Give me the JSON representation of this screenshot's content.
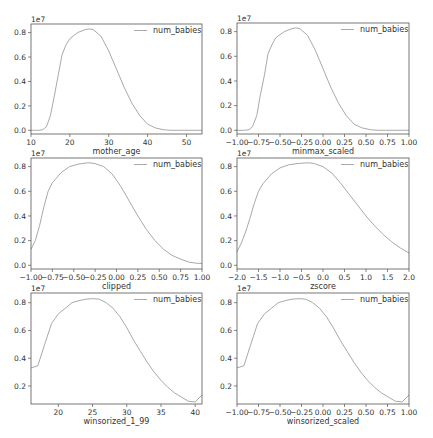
{
  "chart_data": [
    {
      "type": "line",
      "title": "",
      "xlabel": "mother_age",
      "ylabel": "",
      "y_offset_label": "1e7",
      "legend": [
        "num_babies"
      ],
      "legend_position": "upper right",
      "xlim": [
        10,
        54
      ],
      "ylim": [
        -0.03,
        0.87
      ],
      "xticks": [
        10,
        20,
        30,
        40,
        50
      ],
      "yticks": [
        0.0,
        0.2,
        0.4,
        0.6,
        0.8
      ],
      "x": [
        10,
        12,
        13,
        14,
        15,
        16,
        17,
        18,
        19,
        20,
        22,
        24,
        25,
        26,
        28,
        30,
        32,
        34,
        36,
        38,
        40,
        42,
        44,
        46,
        48,
        54
      ],
      "series": [
        {
          "name": "num_babies",
          "values": [
            0.0,
            0.0,
            0.005,
            0.03,
            0.12,
            0.28,
            0.45,
            0.62,
            0.7,
            0.75,
            0.8,
            0.825,
            0.83,
            0.825,
            0.77,
            0.65,
            0.5,
            0.35,
            0.22,
            0.12,
            0.05,
            0.02,
            0.005,
            0.0,
            0.0,
            0.0
          ]
        }
      ]
    },
    {
      "type": "line",
      "title": "",
      "xlabel": "minmax_scaled",
      "ylabel": "",
      "y_offset_label": "1e7",
      "legend": [
        "num_babies"
      ],
      "legend_position": "upper right",
      "xlim": [
        -1.0,
        1.0
      ],
      "ylim": [
        -0.03,
        0.87
      ],
      "xticks": [
        "-1.00",
        "-0.75",
        "-0.50",
        "-0.25",
        "0.00",
        "0.25",
        "0.50",
        "0.75",
        "1.00"
      ],
      "yticks": [
        0.0,
        0.2,
        0.4,
        0.6,
        0.8
      ],
      "x": [
        -1.0,
        -0.91,
        -0.86,
        -0.82,
        -0.77,
        -0.73,
        -0.68,
        -0.64,
        -0.59,
        -0.55,
        -0.45,
        -0.36,
        -0.32,
        -0.27,
        -0.18,
        -0.09,
        0.0,
        0.09,
        0.18,
        0.27,
        0.36,
        0.45,
        0.55,
        0.64,
        0.73,
        1.0
      ],
      "series": [
        {
          "name": "num_babies",
          "values": [
            0.0,
            0.0,
            0.005,
            0.03,
            0.12,
            0.28,
            0.45,
            0.62,
            0.7,
            0.75,
            0.8,
            0.825,
            0.83,
            0.825,
            0.77,
            0.65,
            0.5,
            0.35,
            0.22,
            0.12,
            0.05,
            0.02,
            0.005,
            0.0,
            0.0,
            0.0
          ]
        }
      ]
    },
    {
      "type": "line",
      "title": "",
      "xlabel": "clipped",
      "ylabel": "",
      "y_offset_label": "1e7",
      "legend": [
        "num_babies"
      ],
      "legend_position": "upper right",
      "xlim": [
        -1.0,
        1.0
      ],
      "ylim": [
        -0.03,
        0.87
      ],
      "xticks": [
        "-1.00",
        "-0.75",
        "-0.50",
        "-0.25",
        "0.00",
        "0.25",
        "0.50",
        "0.75",
        "1.00"
      ],
      "yticks": [
        0.0,
        0.2,
        0.4,
        0.6,
        0.8
      ],
      "x": [
        -1.0,
        -0.95,
        -0.9,
        -0.85,
        -0.8,
        -0.75,
        -0.65,
        -0.55,
        -0.45,
        -0.35,
        -0.3,
        -0.25,
        -0.15,
        -0.05,
        0.05,
        0.15,
        0.25,
        0.35,
        0.45,
        0.55,
        0.65,
        0.75,
        0.85,
        0.95,
        1.0
      ],
      "series": [
        {
          "name": "num_babies",
          "values": [
            0.13,
            0.2,
            0.32,
            0.47,
            0.6,
            0.67,
            0.75,
            0.8,
            0.82,
            0.83,
            0.83,
            0.825,
            0.8,
            0.74,
            0.64,
            0.52,
            0.4,
            0.29,
            0.2,
            0.13,
            0.08,
            0.05,
            0.025,
            0.015,
            0.015
          ]
        }
      ]
    },
    {
      "type": "line",
      "title": "",
      "xlabel": "zscore",
      "ylabel": "",
      "y_offset_label": "1e7",
      "legend": [
        "num_babies"
      ],
      "legend_position": "upper right",
      "xlim": [
        -2.0,
        2.0
      ],
      "ylim": [
        -0.03,
        0.87
      ],
      "xticks": [
        "-2.0",
        "-1.5",
        "-1.0",
        "-0.5",
        "0.0",
        "0.5",
        "1.0",
        "1.5",
        "2.0"
      ],
      "yticks": [
        0.0,
        0.2,
        0.4,
        0.6,
        0.8
      ],
      "x": [
        -2.0,
        -1.9,
        -1.8,
        -1.7,
        -1.6,
        -1.5,
        -1.4,
        -1.2,
        -1.0,
        -0.8,
        -0.6,
        -0.4,
        -0.3,
        -0.2,
        0.0,
        0.2,
        0.4,
        0.6,
        0.8,
        1.0,
        1.2,
        1.4,
        1.6,
        1.8,
        2.0
      ],
      "series": [
        {
          "name": "num_babies",
          "values": [
            0.11,
            0.18,
            0.27,
            0.38,
            0.5,
            0.6,
            0.66,
            0.74,
            0.79,
            0.815,
            0.825,
            0.83,
            0.83,
            0.825,
            0.8,
            0.75,
            0.67,
            0.58,
            0.49,
            0.4,
            0.32,
            0.25,
            0.19,
            0.14,
            0.1
          ]
        }
      ]
    },
    {
      "type": "line",
      "title": "",
      "xlabel": "winsorized_1_99",
      "ylabel": "",
      "y_offset_label": "1e7",
      "legend": [
        "num_babies"
      ],
      "legend_position": "upper right",
      "xlim": [
        16,
        41
      ],
      "ylim": [
        0.07,
        0.87
      ],
      "xticks": [
        20,
        25,
        30,
        35,
        40
      ],
      "yticks": [
        0.2,
        0.4,
        0.6,
        0.8
      ],
      "x": [
        16,
        17,
        18,
        19,
        20,
        21,
        22,
        23,
        24,
        25,
        26,
        27,
        28,
        29,
        30,
        31,
        32,
        33,
        34,
        35,
        36,
        37,
        38,
        39,
        40,
        41
      ],
      "series": [
        {
          "name": "num_babies",
          "values": [
            0.33,
            0.345,
            0.5,
            0.65,
            0.72,
            0.76,
            0.8,
            0.815,
            0.825,
            0.83,
            0.825,
            0.8,
            0.76,
            0.7,
            0.62,
            0.53,
            0.45,
            0.37,
            0.3,
            0.24,
            0.19,
            0.15,
            0.12,
            0.09,
            0.085,
            0.135
          ]
        }
      ]
    },
    {
      "type": "line",
      "title": "",
      "xlabel": "winsorized_scaled",
      "ylabel": "",
      "y_offset_label": "1e7",
      "legend": [
        "num_babies"
      ],
      "legend_position": "upper right",
      "xlim": [
        -1.0,
        1.0
      ],
      "ylim": [
        0.07,
        0.87
      ],
      "xticks": [
        "-1.00",
        "-0.75",
        "-0.50",
        "-0.25",
        "0.00",
        "0.25",
        "0.50",
        "0.75",
        "1.00"
      ],
      "yticks": [
        0.2,
        0.4,
        0.6,
        0.8
      ],
      "x": [
        -1.0,
        -0.92,
        -0.84,
        -0.76,
        -0.68,
        -0.6,
        -0.52,
        -0.44,
        -0.36,
        -0.28,
        -0.2,
        -0.12,
        -0.04,
        0.04,
        0.12,
        0.2,
        0.28,
        0.36,
        0.44,
        0.52,
        0.6,
        0.68,
        0.76,
        0.84,
        0.92,
        1.0
      ],
      "series": [
        {
          "name": "num_babies",
          "values": [
            0.33,
            0.345,
            0.5,
            0.65,
            0.72,
            0.76,
            0.8,
            0.815,
            0.825,
            0.83,
            0.825,
            0.8,
            0.76,
            0.7,
            0.62,
            0.53,
            0.45,
            0.37,
            0.3,
            0.24,
            0.19,
            0.15,
            0.12,
            0.09,
            0.085,
            0.135
          ]
        }
      ]
    }
  ],
  "layout": {
    "frames": [
      {
        "left": 31,
        "top": 24,
        "right": 202,
        "bottom": 134
      },
      {
        "left": 237,
        "top": 23,
        "right": 409,
        "bottom": 134
      },
      {
        "left": 31,
        "top": 158,
        "right": 202,
        "bottom": 269
      },
      {
        "left": 237,
        "top": 158,
        "right": 409,
        "bottom": 269
      },
      {
        "left": 31,
        "top": 293,
        "right": 202,
        "bottom": 404
      },
      {
        "left": 237,
        "top": 293,
        "right": 409,
        "bottom": 404
      }
    ]
  }
}
